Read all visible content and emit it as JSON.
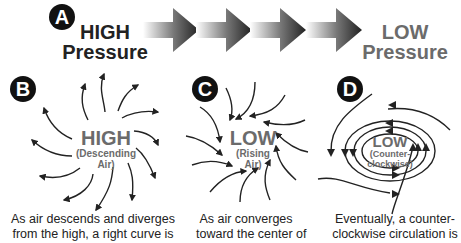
{
  "panels": {
    "A": {
      "badge": "A",
      "high_title_line1": "HIGH",
      "high_title_line2": "Pressure",
      "low_title_line1": "LOW",
      "low_title_line2": "Pressure",
      "arrow_count": 4,
      "arrow_gradient": [
        "#ffffff",
        "#2a2a2a"
      ]
    },
    "B": {
      "badge": "B",
      "center_title": "HIGH",
      "center_subtitle_line1": "(Descending",
      "center_subtitle_line2": "Air)",
      "caption_line1": "As air descends and diverges",
      "caption_line2": "from the high, a right curve is"
    },
    "C": {
      "badge": "C",
      "center_title": "LOW",
      "center_subtitle_line1": "(Rising",
      "center_subtitle_line2": "Air)",
      "caption_line1": "As air converges",
      "caption_line2": "toward the center of"
    },
    "D": {
      "badge": "D",
      "center_title": "LOW",
      "center_subtitle_line1": "(Counter-",
      "center_subtitle_line2": "clockwise)",
      "caption_line1": "Eventually, a counter-",
      "caption_line2": "clockwise circulation is"
    }
  },
  "colors": {
    "dark_text": "#222222",
    "gray_text": "#6b6b6b",
    "badge_bg": "#111111",
    "line": "#222222"
  }
}
